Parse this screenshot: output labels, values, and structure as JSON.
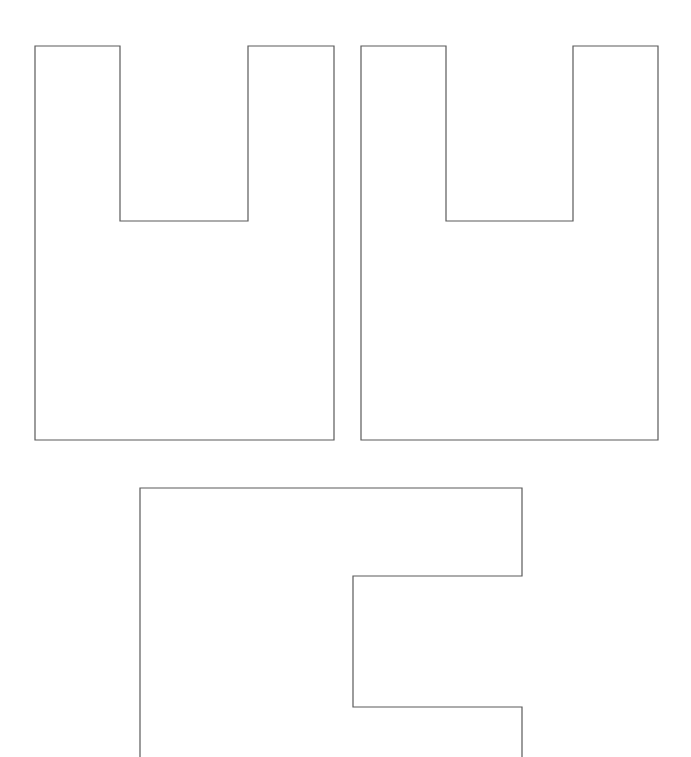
{
  "canvas": {
    "width": 691,
    "height": 757,
    "background": "#ffffff",
    "stroke_color": "#5a5a5a",
    "stroke_width": 1.2
  },
  "shapes": [
    {
      "id": "u-shape-left",
      "kind": "U-shaped outline",
      "points": [
        [
          35,
          46
        ],
        [
          120,
          46
        ],
        [
          120,
          221
        ],
        [
          248,
          221
        ],
        [
          248,
          46
        ],
        [
          334,
          46
        ],
        [
          334,
          440
        ],
        [
          35,
          440
        ]
      ],
      "closed": true
    },
    {
      "id": "u-shape-right",
      "kind": "U-shaped outline",
      "points": [
        [
          361,
          46
        ],
        [
          446,
          46
        ],
        [
          446,
          221
        ],
        [
          573,
          221
        ],
        [
          573,
          46
        ],
        [
          658,
          46
        ],
        [
          658,
          440
        ],
        [
          361,
          440
        ]
      ],
      "closed": true
    },
    {
      "id": "e-shape-bottom",
      "kind": "E-shaped outline (cut off at bottom)",
      "points": [
        [
          140,
          757
        ],
        [
          140,
          488
        ],
        [
          522,
          488
        ],
        [
          522,
          576
        ],
        [
          353,
          576
        ],
        [
          353,
          707
        ],
        [
          522,
          707
        ],
        [
          522,
          757
        ]
      ],
      "closed": false
    }
  ]
}
